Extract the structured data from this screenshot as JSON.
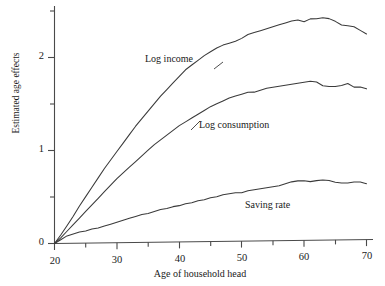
{
  "chart_data": {
    "type": "line",
    "title": "",
    "xlabel": "Age of household head",
    "ylabel": "Estimated age effects",
    "xlim": [
      19,
      71
    ],
    "ylim": [
      -0.06,
      2.55
    ],
    "grid": false,
    "legend_position": "inline-annotations",
    "x_ticks_major": [
      20,
      30,
      40,
      50,
      60,
      70
    ],
    "x_tick_labels": [
      "20",
      "30",
      "40",
      "50",
      "60",
      "70"
    ],
    "x_ticks_minor": [
      25,
      35,
      45,
      55,
      65
    ],
    "y_ticks_major": [
      0,
      1,
      2
    ],
    "y_tick_labels": [
      "0",
      "1",
      "2"
    ],
    "y_ticks_minor": [
      0.5,
      1.5,
      2.5
    ],
    "x": [
      20,
      21,
      22,
      23,
      24,
      25,
      26,
      27,
      28,
      29,
      30,
      31,
      32,
      33,
      34,
      35,
      36,
      37,
      38,
      39,
      40,
      41,
      42,
      43,
      44,
      45,
      46,
      47,
      48,
      49,
      50,
      51,
      52,
      53,
      54,
      55,
      56,
      57,
      58,
      59,
      60,
      61,
      62,
      63,
      64,
      65,
      66,
      67,
      68,
      69,
      70
    ],
    "series": [
      {
        "name": "Log income",
        "label": "Log income",
        "color": "#3a3a3a",
        "values": [
          0.0,
          0.09,
          0.19,
          0.29,
          0.4,
          0.5,
          0.6,
          0.7,
          0.8,
          0.89,
          0.98,
          1.07,
          1.16,
          1.25,
          1.33,
          1.41,
          1.49,
          1.57,
          1.64,
          1.71,
          1.78,
          1.85,
          1.9,
          1.95,
          2.0,
          2.04,
          2.08,
          2.11,
          2.13,
          2.15,
          2.18,
          2.22,
          2.24,
          2.26,
          2.28,
          2.3,
          2.32,
          2.34,
          2.36,
          2.37,
          2.35,
          2.38,
          2.38,
          2.39,
          2.38,
          2.35,
          2.31,
          2.3,
          2.29,
          2.25,
          2.21
        ]
      },
      {
        "name": "Log consumption",
        "label": "Log consumption",
        "color": "#3a3a3a",
        "values": [
          0.0,
          0.06,
          0.13,
          0.2,
          0.27,
          0.34,
          0.41,
          0.48,
          0.55,
          0.62,
          0.69,
          0.75,
          0.81,
          0.87,
          0.93,
          0.99,
          1.05,
          1.1,
          1.15,
          1.2,
          1.25,
          1.29,
          1.33,
          1.37,
          1.41,
          1.45,
          1.48,
          1.51,
          1.54,
          1.56,
          1.58,
          1.6,
          1.6,
          1.62,
          1.64,
          1.65,
          1.66,
          1.67,
          1.68,
          1.69,
          1.7,
          1.71,
          1.7,
          1.66,
          1.65,
          1.65,
          1.66,
          1.68,
          1.64,
          1.64,
          1.62
        ]
      },
      {
        "name": "Saving rate",
        "label": "Saving rate",
        "color": "#3a3a3a",
        "values": [
          0.0,
          0.04,
          0.08,
          0.1,
          0.12,
          0.13,
          0.15,
          0.16,
          0.18,
          0.2,
          0.22,
          0.24,
          0.26,
          0.28,
          0.3,
          0.31,
          0.33,
          0.35,
          0.36,
          0.38,
          0.39,
          0.41,
          0.42,
          0.44,
          0.45,
          0.47,
          0.48,
          0.5,
          0.51,
          0.52,
          0.52,
          0.54,
          0.55,
          0.56,
          0.57,
          0.58,
          0.59,
          0.61,
          0.63,
          0.64,
          0.64,
          0.63,
          0.64,
          0.645,
          0.64,
          0.62,
          0.61,
          0.61,
          0.62,
          0.62,
          0.6
        ]
      }
    ]
  },
  "axis": {
    "ylabel": "Estimated age effects",
    "xlabel": "Age of household head",
    "y_tick_labels": [
      "2",
      "1",
      "0"
    ],
    "x_tick_labels": [
      "20",
      "30",
      "40",
      "50",
      "60",
      "70"
    ]
  },
  "annotations": {
    "log_income": "Log income",
    "log_consumption": "Log consumption",
    "saving_rate": "Saving rate"
  },
  "page_bleed": {
    "text": ""
  }
}
